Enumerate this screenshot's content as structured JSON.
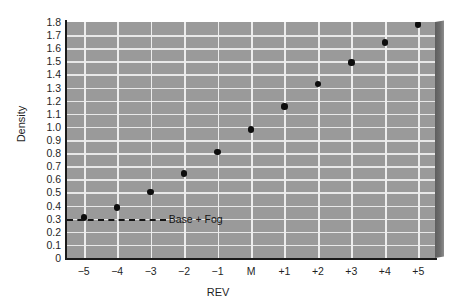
{
  "chart_data": {
    "type": "scatter",
    "title": "",
    "xlabel": "REV",
    "ylabel": "Density",
    "categories": [
      "−5",
      "−4",
      "−3",
      "−2",
      "−1",
      "M",
      "+1",
      "+2",
      "+3",
      "+4",
      "+5"
    ],
    "x": [
      -5,
      -4,
      -3,
      -2,
      -1,
      0,
      1,
      2,
      3,
      4,
      5
    ],
    "values": [
      0.31,
      0.385,
      0.505,
      0.645,
      0.81,
      0.98,
      1.155,
      1.325,
      1.49,
      1.645,
      1.78
    ],
    "series": [
      {
        "name": "Density",
        "values": [
          0.31,
          0.385,
          0.505,
          0.645,
          0.81,
          0.98,
          1.155,
          1.325,
          1.49,
          1.645,
          1.78
        ]
      }
    ],
    "ylim": [
      0,
      1.8
    ],
    "ytick_labels": [
      "1.8",
      "1.7",
      "1.6",
      "1.5",
      "1.4",
      "1.3",
      "1.2",
      "1.1",
      "1.0",
      "0.9",
      "0.8",
      "0.7",
      "0.6",
      "0.5",
      "0.4",
      "0.3",
      "0.2",
      "0.1",
      "0"
    ],
    "ytick_values": [
      1.8,
      1.7,
      1.6,
      1.5,
      1.4,
      1.3,
      1.2,
      1.1,
      1.0,
      0.9,
      0.8,
      0.7,
      0.6,
      0.5,
      0.4,
      0.3,
      0.2,
      0.1,
      0
    ],
    "grid": true,
    "legend": null,
    "annotations": [
      {
        "name": "base-plus-fog",
        "label": "Base + Fog",
        "y": 0.3,
        "x_start": -5.6,
        "x_end": -2.55,
        "style": "dashed-line"
      }
    ],
    "colors": {
      "plot_background": "#9a9a9a",
      "gridline": "#e8e8e8",
      "axis": "#1a1a1a",
      "point": "#0d0d0d",
      "page_background": "#ffffff",
      "shadow": "#6a6a6a"
    }
  }
}
